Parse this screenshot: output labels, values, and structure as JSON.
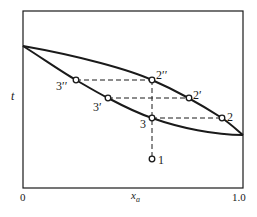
{
  "diagram": {
    "type": "phase-diagram-boiling",
    "colors": {
      "ink": "#1a1a1a",
      "background": "#ffffff"
    },
    "axes": {
      "y_label": "t",
      "x_label_main": "x",
      "x_label_sub": "a",
      "x_tick_left": "0",
      "x_tick_right": "1.0"
    },
    "points": [
      {
        "id": "1",
        "label": "1",
        "x": 152,
        "y": 159
      },
      {
        "id": "2",
        "label": "2",
        "x": 222,
        "y": 118
      },
      {
        "id": "2p",
        "label": "2′",
        "x": 189,
        "y": 98
      },
      {
        "id": "2pp",
        "label": "2′′",
        "x": 152,
        "y": 80
      },
      {
        "id": "3",
        "label": "3",
        "x": 152,
        "y": 118
      },
      {
        "id": "3p",
        "label": "3′",
        "x": 108,
        "y": 98
      },
      {
        "id": "3pp",
        "label": "3′′",
        "x": 76,
        "y": 80
      }
    ],
    "tie_lines": [
      {
        "from": "3pp",
        "to": "2pp"
      },
      {
        "from": "3p",
        "to": "2p"
      },
      {
        "from": "3",
        "to": "2"
      }
    ],
    "vertical_line": {
      "from": "1",
      "to": "2pp"
    }
  }
}
